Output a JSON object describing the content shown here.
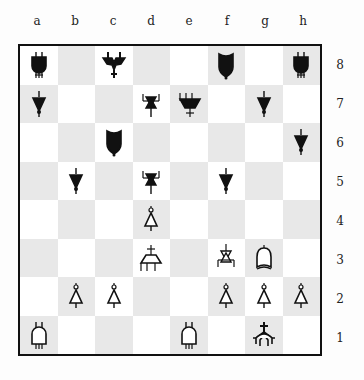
{
  "files": [
    "a",
    "b",
    "c",
    "d",
    "e",
    "f",
    "g",
    "h"
  ],
  "ranks": [
    "8",
    "7",
    "6",
    "5",
    "4",
    "3",
    "2",
    "1"
  ],
  "colors": {
    "light_square": "#ffffff",
    "dark_square": "#e8e8e8",
    "border": "#111111"
  },
  "pieces": [
    {
      "square": "a8",
      "color": "black",
      "type": "rook"
    },
    {
      "square": "c8",
      "color": "black",
      "type": "king"
    },
    {
      "square": "f8",
      "color": "black",
      "type": "bishop"
    },
    {
      "square": "h8",
      "color": "black",
      "type": "rook"
    },
    {
      "square": "a7",
      "color": "black",
      "type": "pawn"
    },
    {
      "square": "d7",
      "color": "black",
      "type": "knight"
    },
    {
      "square": "e7",
      "color": "black",
      "type": "queen"
    },
    {
      "square": "g7",
      "color": "black",
      "type": "pawn"
    },
    {
      "square": "c6",
      "color": "black",
      "type": "bishop"
    },
    {
      "square": "h6",
      "color": "black",
      "type": "pawn"
    },
    {
      "square": "b5",
      "color": "black",
      "type": "pawn"
    },
    {
      "square": "d5",
      "color": "black",
      "type": "knight"
    },
    {
      "square": "f5",
      "color": "black",
      "type": "pawn"
    },
    {
      "square": "d4",
      "color": "white",
      "type": "pawn"
    },
    {
      "square": "d3",
      "color": "white",
      "type": "queen"
    },
    {
      "square": "f3",
      "color": "white",
      "type": "knight"
    },
    {
      "square": "g3",
      "color": "white",
      "type": "bishop"
    },
    {
      "square": "b2",
      "color": "white",
      "type": "pawn"
    },
    {
      "square": "c2",
      "color": "white",
      "type": "pawn"
    },
    {
      "square": "f2",
      "color": "white",
      "type": "pawn"
    },
    {
      "square": "g2",
      "color": "white",
      "type": "pawn"
    },
    {
      "square": "h2",
      "color": "white",
      "type": "pawn"
    },
    {
      "square": "a1",
      "color": "white",
      "type": "rook"
    },
    {
      "square": "e1",
      "color": "white",
      "type": "rook"
    },
    {
      "square": "g1",
      "color": "white",
      "type": "king"
    }
  ]
}
